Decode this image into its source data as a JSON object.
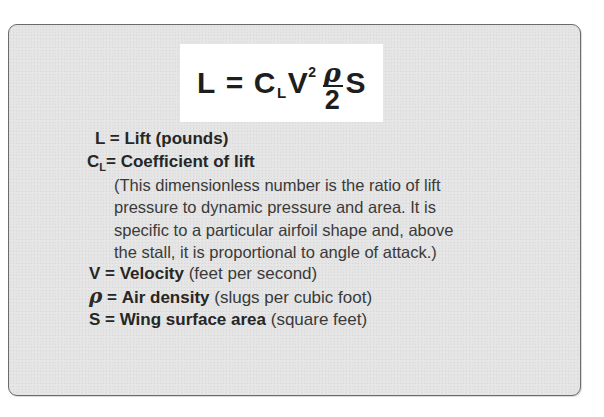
{
  "formula": {
    "lhs": "L",
    "equals": "=",
    "coef": "C",
    "coef_sub": "L",
    "velocity": "V",
    "velocity_exp": "2",
    "frac_num": "ρ",
    "frac_den": "2",
    "area": "S"
  },
  "definitions": [
    {
      "symbol": "L",
      "sub": "",
      "eq": " = ",
      "term": "Lift",
      "detail": " (pounds)"
    },
    {
      "symbol": "C",
      "sub": "L",
      "eq": "= ",
      "term": "Coefficient of lift",
      "detail": ""
    },
    {
      "symbol": "V",
      "sub": "",
      "eq": " = ",
      "term": "Velocity",
      "detail": " (feet per second)"
    },
    {
      "symbol": "ρ",
      "sub": "",
      "eq": " = ",
      "term": "Air density",
      "detail": " (slugs per cubic foot)"
    },
    {
      "symbol": "S",
      "sub": "",
      "eq": " = ",
      "term": "Wing surface area",
      "detail": " (square feet)"
    }
  ],
  "coefficient_note": [
    "(This dimensionless number is the ratio of lift",
    "pressure to dynamic pressure and area. It is",
    "specific to a particular airfoil shape and, above",
    "the stall, it is proportional to angle of attack.)"
  ]
}
